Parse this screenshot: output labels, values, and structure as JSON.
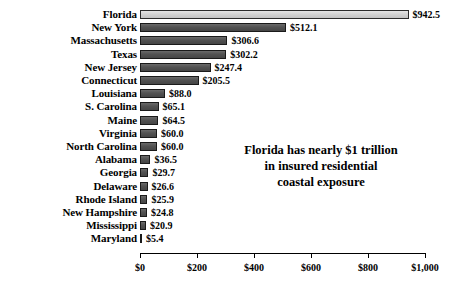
{
  "chart_data": {
    "type": "bar",
    "orientation": "horizontal",
    "title": "",
    "xlabel": "",
    "ylabel": "",
    "xlim": [
      0,
      1000
    ],
    "grid": false,
    "legend": null,
    "tick_labels": [
      "$0",
      "$200",
      "$400",
      "$600",
      "$800",
      "$1,000"
    ],
    "tick_values": [
      0,
      200,
      400,
      600,
      800,
      1000
    ],
    "categories": [
      "Florida",
      "New York",
      "Massachusetts",
      "Texas",
      "New Jersey",
      "Connecticut",
      "Louisiana",
      "S. Carolina",
      "Maine",
      "Virginia",
      "North Carolina",
      "Alabama",
      "Georgia",
      "Delaware",
      "Rhode Island",
      "New Hampshire",
      "Mississippi",
      "Maryland"
    ],
    "values": [
      942.5,
      512.1,
      306.6,
      302.2,
      247.4,
      205.5,
      88.0,
      65.1,
      64.5,
      60.0,
      60.0,
      36.5,
      29.7,
      26.6,
      25.9,
      24.8,
      20.9,
      5.4
    ],
    "value_labels": [
      "$942.5",
      "$512.1",
      "$306.6",
      "$302.2",
      "$247.4",
      "$205.5",
      "$88.0",
      "$65.1",
      "$64.5",
      "$60.0",
      "$60.0",
      "$36.5",
      "$29.7",
      "$26.6",
      "$25.9",
      "$24.8",
      "$20.9",
      "$5.4"
    ],
    "highlight_index": 0,
    "colors": {
      "bar": "#565656",
      "bar_highlight": "#d2d2d2",
      "bar_border": "#1a1a1a",
      "text": "#000000",
      "background": "#ffffff"
    },
    "annotation": {
      "lines": [
        "Florida has nearly $1 trillion",
        "in insured residential",
        "coastal exposure"
      ]
    }
  }
}
